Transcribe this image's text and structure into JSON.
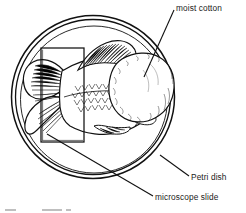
{
  "figure": {
    "type": "scientific-line-diagram",
    "background_color": "#ffffff",
    "ink_color": "#111111",
    "labels": [
      {
        "id": "moist-cotton",
        "text": "moist cotton",
        "leader": "from text down-left to the cotton ball"
      },
      {
        "id": "petri-dish",
        "text": "Petri dish",
        "leader": "from text up-left to the outer dish rim"
      },
      {
        "id": "microscope-slide",
        "text": "microscope slide",
        "leader": "from text up-left to the slide's lower-left corner"
      }
    ],
    "parts": {
      "petri_dish": "two concentric circles forming the dish wall",
      "fish": "fish shown in side view, head to the right, broad caudal fin at left, scaled flank, hatched dorsal fin, small pectoral and anal fins",
      "microscope_slide": "tall upright rectangle overlaying the fish's tail region",
      "moist_cotton": "irregular rounded mass of cotton at the fish's head, stippled outline"
    },
    "caption": ""
  }
}
